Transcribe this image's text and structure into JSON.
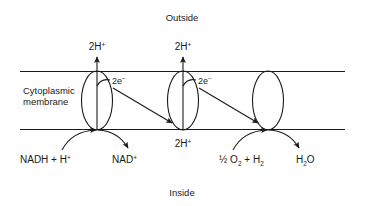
{
  "diagram": {
    "title_top": "Outside",
    "title_bottom": "Inside",
    "membrane_label_line1": "Cytoplasmic",
    "membrane_label_line2": "membrane",
    "colors": {
      "ink": "#1a1a1a",
      "background": "#ffffff"
    },
    "proton_labels_top": [
      {
        "base": "2H",
        "charge": "+"
      },
      {
        "base": "2H",
        "charge": "+"
      }
    ],
    "proton_label_inside": {
      "base": "2H",
      "charge": "+"
    },
    "electron_labels": [
      {
        "base": "2e",
        "charge": "−"
      },
      {
        "base": "2e",
        "charge": "−"
      }
    ],
    "substrates": {
      "donor_in": {
        "p1": "NADH + H",
        "sup1": "+"
      },
      "donor_out": {
        "p1": "NAD",
        "sup1": "+"
      },
      "acceptor_in": {
        "p1": "½ O",
        "sub1": "2",
        "p2": " + H",
        "sub2": "2"
      },
      "acceptor_out": {
        "p1": "H",
        "sub1": "2",
        "p2": "O"
      }
    },
    "complexes": [
      {
        "name": "complex-1"
      },
      {
        "name": "complex-2"
      },
      {
        "name": "complex-3"
      }
    ]
  }
}
